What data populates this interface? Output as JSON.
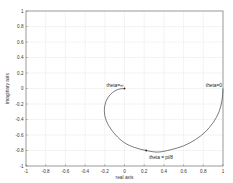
{
  "chart_data": {
    "type": "line",
    "title": "",
    "xlabel": "real axis",
    "ylabel": "imaginary axis",
    "xlim": [
      -1,
      1
    ],
    "ylim": [
      -1,
      1
    ],
    "grid": true,
    "xticks": [
      "-1",
      "-0.8",
      "-0.6",
      "-0.4",
      "-0.2",
      "0",
      "0.2",
      "0.4",
      "0.6",
      "0.8",
      "1"
    ],
    "yticks": [
      "1",
      "0.8",
      "0.6",
      "0.4",
      "0.2",
      "0",
      "-0.2",
      "-0.4",
      "-0.6",
      "-0.8",
      "-1"
    ],
    "series": [
      {
        "name": "nyquist curve",
        "x": [
          1.0,
          0.99,
          0.96,
          0.9,
          0.82,
          0.72,
          0.6,
          0.47,
          0.34,
          0.22,
          0.1,
          0.0,
          -0.09,
          -0.16,
          -0.2,
          -0.2,
          -0.17,
          -0.12,
          -0.06,
          0.0
        ],
        "y": [
          0.0,
          -0.15,
          -0.3,
          -0.44,
          -0.56,
          -0.66,
          -0.74,
          -0.79,
          -0.82,
          -0.8,
          -0.76,
          -0.7,
          -0.6,
          -0.48,
          -0.35,
          -0.22,
          -0.12,
          -0.05,
          -0.01,
          0.0
        ]
      }
    ],
    "annotations": [
      {
        "text": "theta=0",
        "x": 1.0,
        "y": 0.0
      },
      {
        "text": "theta=∞",
        "x": 0.0,
        "y": 0.0
      },
      {
        "text": "theta = pi/8",
        "x": 0.22,
        "y": -0.8
      }
    ],
    "markers": [
      {
        "x": 0.0,
        "y": 0.0
      },
      {
        "x": 0.22,
        "y": -0.8
      }
    ]
  }
}
